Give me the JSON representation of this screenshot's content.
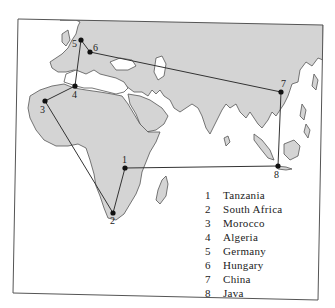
{
  "map": {
    "colors": {
      "land": "#d2d2d2",
      "land_dark": "#bdbdbd",
      "coast": "#555555",
      "route": "#333333",
      "frame": "#555555",
      "water": "#ffffff"
    },
    "points": [
      {
        "id": "1",
        "label": "1",
        "name": "Tanzania",
        "x": 125,
        "y": 168
      },
      {
        "id": "2",
        "label": "2",
        "name": "South Africa",
        "x": 113,
        "y": 213
      },
      {
        "id": "3",
        "label": "3",
        "name": "Morocco",
        "x": 45,
        "y": 101
      },
      {
        "id": "4",
        "label": "4",
        "name": "Algeria",
        "x": 75,
        "y": 86
      },
      {
        "id": "5",
        "label": "5",
        "name": "Germany",
        "x": 81,
        "y": 40
      },
      {
        "id": "6",
        "label": "6",
        "name": "Hungary",
        "x": 90,
        "y": 52
      },
      {
        "id": "7",
        "label": "7",
        "name": "China",
        "x": 281,
        "y": 92
      },
      {
        "id": "8",
        "label": "8",
        "name": "Java",
        "x": 278,
        "y": 166
      }
    ],
    "route_order": [
      "6",
      "5",
      "4",
      "3",
      "2",
      "1",
      "8",
      "7",
      "6"
    ]
  },
  "legend": {
    "items": [
      {
        "num": "1",
        "name": "Tanzania"
      },
      {
        "num": "2",
        "name": "South Africa"
      },
      {
        "num": "3",
        "name": "Morocco"
      },
      {
        "num": "4",
        "name": "Algeria"
      },
      {
        "num": "5",
        "name": "Germany"
      },
      {
        "num": "6",
        "name": "Hungary"
      },
      {
        "num": "7",
        "name": "China"
      },
      {
        "num": "8",
        "name": "Java"
      }
    ]
  }
}
